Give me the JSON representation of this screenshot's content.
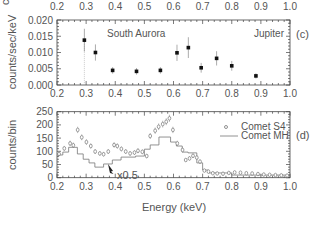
{
  "chart_data": [
    {
      "panel": "(c)",
      "type": "scatter",
      "title": "",
      "xlabel": "",
      "ylabel": "counts/sec/keV",
      "xlim": [
        0.2,
        1.0
      ],
      "ylim": [
        0.0,
        0.02
      ],
      "xticks": [
        "0.2",
        "0.3",
        "0.4",
        "0.5",
        "0.6",
        "0.7",
        "0.8",
        "0.9",
        "1.0"
      ],
      "yticks": [
        "0.000",
        "0.005",
        "0.010",
        "0.015",
        "0.020"
      ],
      "grid": false,
      "annotations": [
        "South Aurora",
        "Jupiter"
      ],
      "series": [
        {
          "name": "South Aurora (Jupiter)",
          "marker": "filled-square-with-errorbars",
          "x": [
            0.294,
            0.332,
            0.391,
            0.473,
            0.555,
            0.612,
            0.651,
            0.695,
            0.748,
            0.8,
            0.883
          ],
          "y": [
            0.0138,
            0.01,
            0.0045,
            0.0042,
            0.0045,
            0.0099,
            0.0115,
            0.0053,
            0.0082,
            0.0059,
            0.0028
          ],
          "yerr": [
            0.0035,
            0.0025,
            0.001,
            0.001,
            0.001,
            0.0025,
            0.0032,
            0.0015,
            0.0022,
            0.0015,
            0.0008
          ]
        }
      ],
      "vline_x": 0.294
    },
    {
      "panel": "(d)",
      "type": "line",
      "title": "",
      "xlabel": "Energy (keV)",
      "ylabel": "counts/bin",
      "xlim": [
        0.2,
        1.0
      ],
      "ylim": [
        0,
        250
      ],
      "xticks": [
        "0.2",
        "0.3",
        "0.4",
        "0.5",
        "0.6",
        "0.7",
        "0.8",
        "0.9",
        "1.0"
      ],
      "yticks": [
        "0",
        "50",
        "100",
        "150",
        "200",
        "250"
      ],
      "grid": false,
      "legend": {
        "position": "upper right",
        "entries": [
          "Comet S4",
          "Comet MH"
        ]
      },
      "annotations": [
        "x0.5"
      ],
      "series": [
        {
          "name": "Comet S4",
          "marker": "open-circle-with-errorbars",
          "x": [
            0.207,
            0.225,
            0.245,
            0.256,
            0.271,
            0.285,
            0.301,
            0.316,
            0.331,
            0.347,
            0.36,
            0.376,
            0.396,
            0.407,
            0.421,
            0.436,
            0.451,
            0.466,
            0.478,
            0.493,
            0.508,
            0.52,
            0.537,
            0.549,
            0.563,
            0.575,
            0.586,
            0.598,
            0.613,
            0.631,
            0.642,
            0.655,
            0.667,
            0.68,
            0.691,
            0.706,
            0.72,
            0.735,
            0.75,
            0.77,
            0.79,
            0.81,
            0.83,
            0.85,
            0.87,
            0.89,
            0.91,
            0.93,
            0.95,
            0.97,
            0.99
          ],
          "y": [
            90,
            111,
            130,
            123,
            181,
            153,
            135,
            120,
            99,
            92,
            89,
            99,
            124,
            120,
            109,
            99,
            92,
            95,
            102,
            98,
            82,
            158,
            178,
            193,
            203,
            212,
            225,
            181,
            130,
            105,
            67,
            73,
            83,
            76,
            61,
            27,
            23,
            17,
            16,
            15,
            18,
            20,
            19,
            17,
            16,
            14,
            12,
            11,
            10,
            9,
            8
          ]
        },
        {
          "name": "Comet MH",
          "style": "step",
          "scale_note": "x0.5",
          "edges": [
            0.2,
            0.22,
            0.24,
            0.27,
            0.29,
            0.31,
            0.33,
            0.36,
            0.39,
            0.42,
            0.47,
            0.5,
            0.52,
            0.55,
            0.59,
            0.61,
            0.63,
            0.65,
            0.68,
            0.7,
            0.72,
            0.8,
            1.0
          ],
          "values": [
            86,
            97,
            115,
            90,
            70,
            56,
            40,
            52,
            67,
            78,
            82,
            108,
            124,
            154,
            135,
            120,
            97,
            94,
            56,
            29,
            18,
            10
          ]
        }
      ]
    }
  ],
  "labels": {
    "panel_c": "(c)",
    "panel_d": "(d)",
    "south_aurora": "South Aurora",
    "jupiter": "Jupiter",
    "ylabel_top": "counts/sec/keV",
    "ylabel_bottom": "counts/bin",
    "xlabel": "Energy (keV)",
    "legend_s4": "Comet S4",
    "legend_mh": "Comet MH",
    "scale_note": "x0.5",
    "cut_top_label": "c"
  },
  "colors": {
    "axis": "#444444",
    "text": "#555555",
    "points": "#111111",
    "errorbar": "#888888",
    "open_marker": "#777777",
    "histogram": "#777777"
  }
}
